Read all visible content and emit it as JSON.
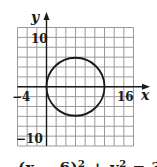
{
  "chart_data": {
    "type": "line",
    "title": "",
    "xlabel": "x",
    "ylabel": "y",
    "xlim": [
      -6,
      18
    ],
    "ylim": [
      -12,
      12
    ],
    "grid": true,
    "grid_step": 2,
    "tick_labels": {
      "x": [
        "-4",
        "16"
      ],
      "y": [
        "10",
        "-10"
      ]
    },
    "series": [
      {
        "name": "circle",
        "shape": "circle",
        "center": [
          6,
          0
        ],
        "radius": 6,
        "equation": "(x − 6)² + y² = 36"
      }
    ],
    "caption": "(x − 6)² + y² = 36"
  },
  "labels": {
    "x_axis": "x",
    "y_axis": "y",
    "x_neg": "−4",
    "x_pos": "16",
    "y_pos": "10",
    "y_neg": "−10",
    "eq_left": "(x − 6)",
    "eq_exp1": "2",
    "eq_mid": " + y",
    "eq_exp2": "2",
    "eq_right": " = 36"
  },
  "colors": {
    "grid": "#9a9a9a",
    "axis": "#1a1a1a",
    "curve": "#1a1a1a"
  }
}
